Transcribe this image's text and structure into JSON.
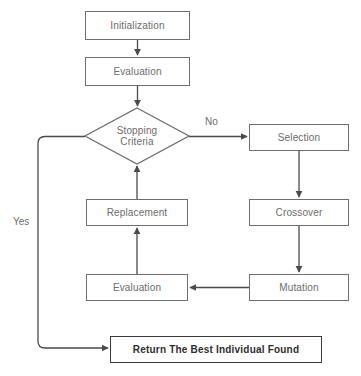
{
  "diagram": {
    "background_color": "#ffffff",
    "line_color": "#6e6e6e",
    "text_color": "#6b6b6b",
    "emphasis_color": "#2e2e2e",
    "nodes": [
      {
        "id": "initialization",
        "label": "Initialization",
        "shape": "rectangle",
        "x": 85,
        "y": 11,
        "w": 105,
        "h": 29
      },
      {
        "id": "evaluation_top",
        "label": "Evaluation",
        "shape": "rectangle",
        "x": 85,
        "y": 57,
        "w": 105,
        "h": 29
      },
      {
        "id": "stopping_criteria",
        "label": "Stopping\nCriteria",
        "label_line1": "Stopping",
        "label_line2": "Criteria",
        "shape": "diamond",
        "x": 85,
        "y": 108,
        "w": 104,
        "h": 56
      },
      {
        "id": "selection",
        "label": "Selection",
        "shape": "rectangle",
        "x": 249,
        "y": 124,
        "w": 100,
        "h": 27
      },
      {
        "id": "crossover",
        "label": "Crossover",
        "shape": "rectangle",
        "x": 249,
        "y": 199,
        "w": 100,
        "h": 27
      },
      {
        "id": "mutation",
        "label": "Mutation",
        "shape": "rectangle",
        "x": 249,
        "y": 274,
        "w": 100,
        "h": 27
      },
      {
        "id": "replacement",
        "label": "Replacement",
        "shape": "rectangle",
        "x": 86,
        "y": 199,
        "w": 102,
        "h": 27
      },
      {
        "id": "evaluation_bottom",
        "label": "Evaluation",
        "shape": "rectangle",
        "x": 86,
        "y": 274,
        "w": 102,
        "h": 27
      },
      {
        "id": "return_best",
        "label": "Return The Best Individual Found",
        "shape": "rectangle",
        "x": 110,
        "y": 336,
        "w": 212,
        "h": 27,
        "emphasis": true
      }
    ],
    "edges": [
      {
        "id": "init-to-eval",
        "from": "initialization",
        "to": "evaluation_top",
        "label": ""
      },
      {
        "id": "eval-to-stopping",
        "from": "evaluation_top",
        "to": "stopping_criteria",
        "label": ""
      },
      {
        "id": "stopping-to-selection",
        "from": "stopping_criteria",
        "to": "selection",
        "label": "No"
      },
      {
        "id": "selection-to-crossover",
        "from": "selection",
        "to": "crossover",
        "label": ""
      },
      {
        "id": "crossover-to-mutation",
        "from": "crossover",
        "to": "mutation",
        "label": ""
      },
      {
        "id": "mutation-to-evaluation",
        "from": "mutation",
        "to": "evaluation_bottom",
        "label": ""
      },
      {
        "id": "evaluation-to-replacement",
        "from": "evaluation_bottom",
        "to": "replacement",
        "label": ""
      },
      {
        "id": "replacement-to-stopping",
        "from": "replacement",
        "to": "stopping_criteria",
        "label": ""
      },
      {
        "id": "stopping-to-return",
        "from": "stopping_criteria",
        "to": "return_best",
        "label": "Yes"
      }
    ],
    "labels": {
      "no_label": "No",
      "no_x": 205,
      "no_y": 116,
      "yes_label": "Yes",
      "yes_x": 13,
      "yes_y": 216
    }
  }
}
